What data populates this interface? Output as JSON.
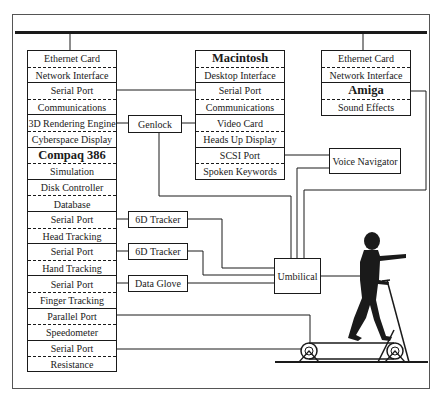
{
  "diagram": {
    "left_column": [
      {
        "top": "Ethernet Card",
        "bottom": "Network Interface",
        "top_bold": false
      },
      {
        "top": "Serial Port",
        "bottom": "Communications",
        "top_bold": false
      },
      {
        "top": "3D Rendering Engine",
        "bottom": "Cyberspace Display",
        "top_bold": false
      },
      {
        "top": "Compaq 386",
        "bottom": "Simulation",
        "top_bold": true
      },
      {
        "top": "Disk Controller",
        "bottom": "Database",
        "top_bold": false
      },
      {
        "top": "Serial Port",
        "bottom": "Head Tracking",
        "top_bold": false
      },
      {
        "top": "Serial Port",
        "bottom": "Hand Tracking",
        "top_bold": false
      },
      {
        "top": "Serial Port",
        "bottom": "Finger Tracking",
        "top_bold": false
      },
      {
        "top": "Parallel Port",
        "bottom": "Speedometer",
        "top_bold": false
      },
      {
        "top": "Serial Port",
        "bottom": "Resistance",
        "top_bold": false
      }
    ],
    "middle_column": [
      {
        "top": "Macintosh",
        "bottom": "Desktop Interface",
        "top_bold": true
      },
      {
        "top": "Serial Port",
        "bottom": "Communications",
        "top_bold": false
      },
      {
        "top": "Video Card",
        "bottom": "Heads Up Display",
        "top_bold": false
      },
      {
        "top": "SCSI Port",
        "bottom": "Spoken Keywords",
        "top_bold": false
      }
    ],
    "right_column": [
      {
        "top": "Ethernet Card",
        "bottom": "Network Interface",
        "top_bold": false
      },
      {
        "top": "Amiga",
        "bottom": "Sound  Effects",
        "top_bold": true
      }
    ],
    "devices": {
      "genlock": "Genlock",
      "tracker_head": "6D Tracker",
      "tracker_hand": "6D Tracker",
      "data_glove": "Data Glove",
      "voice_navigator": "Voice Navigator",
      "umbilical": "Umbilical"
    },
    "figure": "person-on-treadmill"
  }
}
